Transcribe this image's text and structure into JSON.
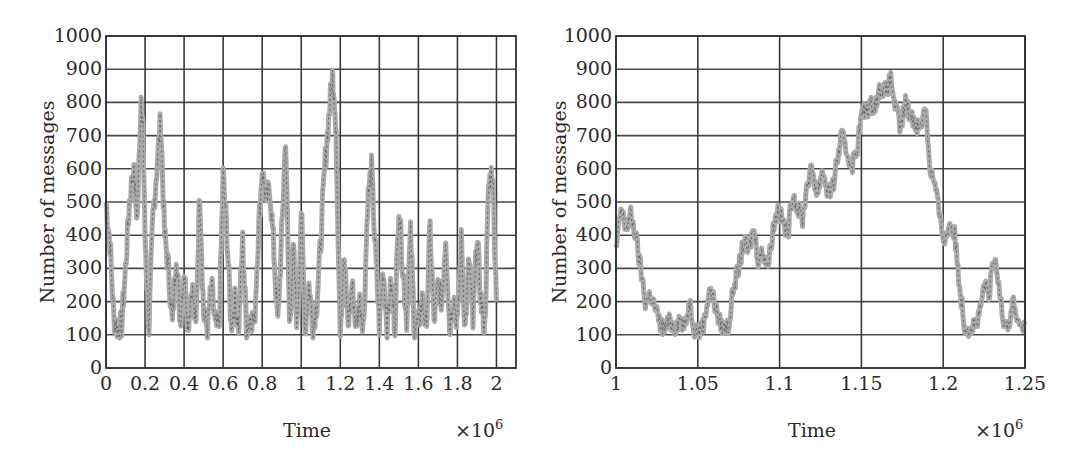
{
  "chart_data": [
    {
      "type": "line",
      "title": "",
      "xlabel": "Time",
      "ylabel": "Number of messages",
      "x_multiplier": "×10^6",
      "x_multiplier_base": "×10",
      "x_multiplier_exp": "6",
      "xlim": [
        0,
        2.1
      ],
      "ylim": [
        0,
        1000
      ],
      "grid": true,
      "legend": null,
      "xticks": [
        0,
        0.2,
        0.4,
        0.6,
        0.8,
        1,
        1.2,
        1.4,
        1.6,
        1.8,
        2
      ],
      "xtick_labels": [
        "0",
        "0.2",
        "0.4",
        "0.6",
        "0.8",
        "1",
        "1.2",
        "1.4",
        "1.6",
        "1.8",
        "2"
      ],
      "yticks": [
        0,
        100,
        200,
        300,
        400,
        500,
        600,
        700,
        800,
        900,
        1000
      ],
      "ytick_labels": [
        "0",
        "100",
        "200",
        "300",
        "400",
        "500",
        "600",
        "700",
        "800",
        "900",
        "1000"
      ],
      "series": [
        {
          "name": "queue length",
          "color": "#aaaaaa",
          "x": [
            0.0,
            0.02,
            0.04,
            0.06,
            0.08,
            0.1,
            0.12,
            0.14,
            0.16,
            0.18,
            0.19,
            0.2,
            0.22,
            0.24,
            0.26,
            0.28,
            0.3,
            0.32,
            0.34,
            0.36,
            0.38,
            0.4,
            0.42,
            0.44,
            0.46,
            0.48,
            0.5,
            0.52,
            0.54,
            0.56,
            0.58,
            0.6,
            0.62,
            0.64,
            0.66,
            0.68,
            0.7,
            0.72,
            0.74,
            0.76,
            0.78,
            0.8,
            0.82,
            0.84,
            0.86,
            0.88,
            0.9,
            0.92,
            0.94,
            0.96,
            0.98,
            1.0,
            1.02,
            1.04,
            1.06,
            1.08,
            1.1,
            1.12,
            1.14,
            1.16,
            1.17,
            1.18,
            1.2,
            1.22,
            1.24,
            1.26,
            1.28,
            1.3,
            1.32,
            1.34,
            1.36,
            1.38,
            1.4,
            1.42,
            1.44,
            1.46,
            1.48,
            1.5,
            1.52,
            1.54,
            1.56,
            1.58,
            1.6,
            1.62,
            1.64,
            1.66,
            1.68,
            1.7,
            1.72,
            1.74,
            1.76,
            1.78,
            1.8,
            1.82,
            1.84,
            1.86,
            1.88,
            1.9,
            1.92,
            1.94,
            1.96,
            1.98,
            2.0
          ],
          "y": [
            500,
            380,
            150,
            120,
            130,
            300,
            500,
            600,
            450,
            820,
            700,
            400,
            120,
            450,
            600,
            750,
            400,
            300,
            130,
            350,
            140,
            300,
            130,
            250,
            120,
            540,
            160,
            120,
            250,
            120,
            130,
            580,
            400,
            130,
            200,
            130,
            380,
            120,
            160,
            130,
            400,
            600,
            500,
            540,
            350,
            130,
            400,
            700,
            130,
            350,
            120,
            480,
            110,
            250,
            130,
            200,
            380,
            600,
            750,
            880,
            820,
            650,
            130,
            330,
            130,
            250,
            130,
            200,
            130,
            500,
            600,
            350,
            130,
            300,
            130,
            250,
            130,
            500,
            300,
            150,
            400,
            120,
            130,
            200,
            120,
            420,
            140,
            250,
            200,
            400,
            120,
            220,
            130,
            380,
            120,
            330,
            130,
            400,
            200,
            120,
            550,
            600,
            200
          ]
        }
      ]
    },
    {
      "type": "line",
      "title": "",
      "xlabel": "Time",
      "ylabel": "Number of messages",
      "x_multiplier": "×10^6",
      "x_multiplier_base": "×10",
      "x_multiplier_exp": "6",
      "xlim": [
        1,
        1.25
      ],
      "ylim": [
        0,
        1000
      ],
      "grid": true,
      "legend": null,
      "xticks": [
        1,
        1.05,
        1.1,
        1.15,
        1.2,
        1.25
      ],
      "xtick_labels": [
        "1",
        "1.05",
        "1.1",
        "1.15",
        "1.2",
        "1.25"
      ],
      "yticks": [
        0,
        100,
        200,
        300,
        400,
        500,
        600,
        700,
        800,
        900,
        1000
      ],
      "ytick_labels": [
        "0",
        "100",
        "200",
        "300",
        "400",
        "500",
        "600",
        "700",
        "800",
        "900",
        "1000"
      ],
      "series": [
        {
          "name": "queue length (zoom)",
          "color": "#aaaaaa",
          "x": [
            1.0,
            1.003,
            1.006,
            1.009,
            1.012,
            1.015,
            1.018,
            1.021,
            1.024,
            1.027,
            1.03,
            1.033,
            1.036,
            1.039,
            1.042,
            1.045,
            1.048,
            1.051,
            1.054,
            1.057,
            1.06,
            1.063,
            1.066,
            1.069,
            1.072,
            1.075,
            1.078,
            1.081,
            1.084,
            1.087,
            1.09,
            1.093,
            1.096,
            1.099,
            1.102,
            1.105,
            1.108,
            1.111,
            1.114,
            1.117,
            1.12,
            1.123,
            1.126,
            1.129,
            1.132,
            1.135,
            1.138,
            1.141,
            1.144,
            1.147,
            1.15,
            1.153,
            1.156,
            1.159,
            1.162,
            1.165,
            1.168,
            1.171,
            1.174,
            1.177,
            1.18,
            1.183,
            1.186,
            1.189,
            1.192,
            1.195,
            1.198,
            1.201,
            1.204,
            1.207,
            1.21,
            1.213,
            1.216,
            1.219,
            1.222,
            1.225,
            1.228,
            1.231,
            1.234,
            1.237,
            1.24,
            1.243,
            1.246,
            1.25
          ],
          "y": [
            350,
            480,
            420,
            460,
            400,
            300,
            200,
            220,
            180,
            130,
            120,
            140,
            120,
            150,
            120,
            200,
            120,
            110,
            140,
            240,
            200,
            140,
            120,
            130,
            250,
            300,
            380,
            350,
            420,
            330,
            350,
            310,
            420,
            480,
            440,
            400,
            530,
            480,
            450,
            560,
            600,
            520,
            600,
            540,
            530,
            620,
            700,
            650,
            610,
            650,
            760,
            780,
            790,
            800,
            850,
            830,
            870,
            780,
            720,
            800,
            760,
            740,
            720,
            800,
            600,
            550,
            450,
            380,
            440,
            400,
            250,
            130,
            120,
            130,
            150,
            250,
            220,
            330,
            250,
            150,
            130,
            200,
            130,
            130
          ]
        }
      ]
    }
  ],
  "panels": {
    "left": {
      "ylabel": "Number of messages",
      "xlabel": "Time",
      "multiplier_base": "×10",
      "multiplier_exp": "6"
    },
    "right": {
      "ylabel": "Number of messages",
      "xlabel": "Time",
      "multiplier_base": "×10",
      "multiplier_exp": "6"
    }
  }
}
